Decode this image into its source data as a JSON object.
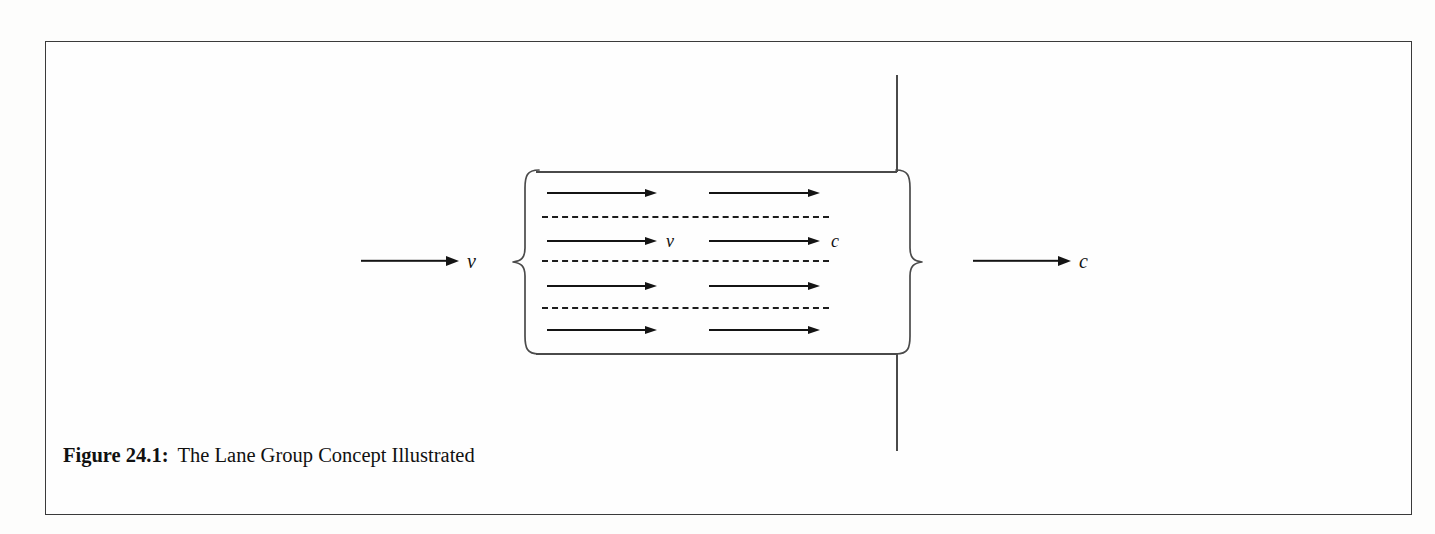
{
  "figure": {
    "caption_label": "Figure 24.1:",
    "caption_text": "The Lane Group Concept Illustrated"
  },
  "diagram": {
    "approach_arrow": {
      "name": "approach-volume-arrow",
      "label": "v",
      "x1": 360,
      "x2": 458,
      "y": 260,
      "label_x": 466
    },
    "departure_arrow": {
      "name": "departure-capacity-arrow",
      "label": "c",
      "x1": 972,
      "x2": 1070,
      "y": 260,
      "label_x": 1078
    },
    "road": {
      "top_edge_y": 170,
      "bottom_edge_y": 352,
      "left_x": 535,
      "right_x": 895
    },
    "cross_street": {
      "x": 895,
      "top_y": 74,
      "bottom_y": 450
    },
    "left_brace": {
      "x": 510,
      "y": 167,
      "width": 30,
      "height": 188
    },
    "right_brace": {
      "x": 893,
      "y": 167,
      "width": 30,
      "height": 188
    },
    "lane_arrows_left": [
      {
        "y": 192,
        "x1": 546,
        "x2": 657,
        "label": ""
      },
      {
        "y": 240,
        "x1": 546,
        "x2": 657,
        "label": "v",
        "label_x": 665
      },
      {
        "y": 285,
        "x1": 546,
        "x2": 657,
        "label": ""
      },
      {
        "y": 329,
        "x1": 546,
        "x2": 657,
        "label": ""
      }
    ],
    "lane_arrows_right": [
      {
        "y": 192,
        "x1": 708,
        "x2": 820,
        "label": ""
      },
      {
        "y": 240,
        "x1": 708,
        "x2": 820,
        "label": "c",
        "label_x": 830
      },
      {
        "y": 285,
        "x1": 708,
        "x2": 820,
        "label": ""
      },
      {
        "y": 329,
        "x1": 708,
        "x2": 820,
        "label": ""
      }
    ],
    "lane_dividers": [
      {
        "y": 215,
        "x1": 541,
        "x2": 828
      },
      {
        "y": 259,
        "x1": 541,
        "x2": 828
      },
      {
        "y": 306,
        "x1": 541,
        "x2": 828
      }
    ],
    "colors": {
      "ink": "#141414",
      "rule": "#4a4a4a",
      "border": "#3a3a3a",
      "page": "#fefefe"
    }
  }
}
